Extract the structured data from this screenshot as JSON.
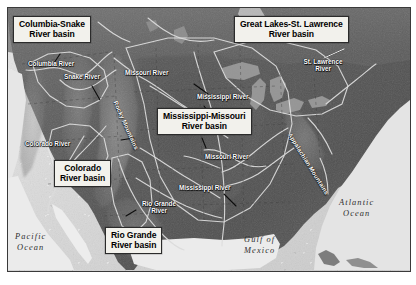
{
  "map": {
    "title": "Major river basins of North America",
    "colors": {
      "label_box_fill": "#f2f1ec",
      "label_box_border": "#2b2b2b",
      "land": "#5a5a5a",
      "highland": "#8d8d8d",
      "water": "#e4e4e4",
      "river_line": "#d8d8d8",
      "basin_outline": "#e8e8e8",
      "leader_line": "#111111",
      "frame_border": "#3a3a3a"
    },
    "basin_labels": [
      {
        "id": "columbia-snake",
        "line1": "Columbia-Snake",
        "line2": "River basin",
        "x": 12,
        "y": 15
      },
      {
        "id": "great-lakes-st-lawrence",
        "line1": "Great Lakes-St. Lawrence",
        "line2": "River basin",
        "x": 233,
        "y": 15
      },
      {
        "id": "mississippi-missouri",
        "line1": "Mississippi-Missouri",
        "line2": "River basin",
        "x": 156,
        "y": 107
      },
      {
        "id": "colorado",
        "line1": "Colorado",
        "line2": "River basin",
        "x": 53,
        "y": 159
      },
      {
        "id": "rio-grande",
        "line1": "Rio Grande",
        "line2": "River basin",
        "x": 104,
        "y": 226
      }
    ],
    "river_labels": [
      {
        "id": "columbia-river",
        "text": "Columbia River",
        "x": 27,
        "y": 59
      },
      {
        "id": "snake-river",
        "text": "Snake River",
        "x": 63,
        "y": 72
      },
      {
        "id": "missouri-river-upper",
        "text": "Missouri River",
        "x": 124,
        "y": 68
      },
      {
        "id": "mississippi-river-upper",
        "text": "Mississippi River",
        "x": 196,
        "y": 92
      },
      {
        "id": "st-lawrence-river",
        "text": "St. Lawrence",
        "text2": "River",
        "x": 297,
        "y": 57
      },
      {
        "id": "colorado-river",
        "text": "Colorado River",
        "x": 24,
        "y": 139
      },
      {
        "id": "missouri-river-lower",
        "text": "Missouri River",
        "x": 204,
        "y": 152
      },
      {
        "id": "mississippi-river-lower",
        "text": "Mississippi River",
        "x": 178,
        "y": 183
      },
      {
        "id": "rio-grande-river",
        "text": "Rio Grande",
        "text2": "River",
        "x": 131,
        "y": 199
      }
    ],
    "range_labels": [
      {
        "id": "rocky-mountains",
        "text": "Rocky Mountains",
        "x": 110,
        "y": 100,
        "rotation": 66
      },
      {
        "id": "appalachian-mountains",
        "text": "Appalachian Mountains",
        "x": 287,
        "y": 131,
        "rotation": 58
      }
    ],
    "ocean_labels": [
      {
        "id": "pacific-ocean",
        "line1": "Pacific",
        "line2": "Ocean",
        "x": 14,
        "y": 231
      },
      {
        "id": "atlantic-ocean",
        "line1": "Atlantic",
        "line2": "Ocean",
        "x": 338,
        "y": 197
      },
      {
        "id": "gulf-of-mexico",
        "line1": "Gulf of",
        "line2": "Mexico",
        "x": 243,
        "y": 234
      }
    ]
  }
}
